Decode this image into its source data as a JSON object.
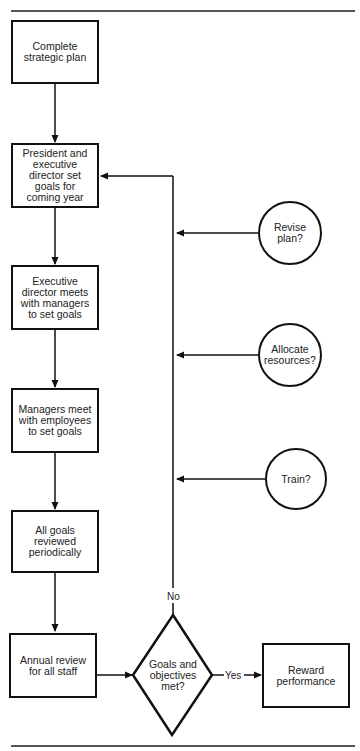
{
  "header": {
    "caption_fragment": "...goals are set, reviewed and evaluated..."
  },
  "nodes": {
    "complete_plan": "Complete strategic plan",
    "president_goals": "President and executive director set goals for coming year",
    "exec_director_goals": "Executive director meets with managers to set goals",
    "managers_goals": "Managers meet with employees to set goals",
    "goals_reviewed": "All goals reviewed periodically",
    "annual_review": "Annual review for all staff",
    "decision": "Goals and objectives met?",
    "reward": "Reward performance"
  },
  "feedback": {
    "revise": "Revise plan?",
    "allocate": "Allocate resources?",
    "train": "Train?"
  },
  "edges": {
    "no_label": "No",
    "yes_label": "Yes"
  },
  "colors": {
    "stroke": "#111111",
    "background": "#ffffff",
    "rule": "#555555"
  }
}
